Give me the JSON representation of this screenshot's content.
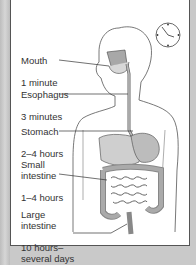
{
  "diagram": {
    "icon": "clock-icon",
    "labels": [
      {
        "organ": "Mouth",
        "time": "1 minute"
      },
      {
        "organ": "Esophagus",
        "time": "3 minutes"
      },
      {
        "organ": "Stomach",
        "time": "2–4 hours"
      },
      {
        "organ": "Small\nintestine",
        "time": "1–4 hours"
      },
      {
        "organ": "Large\nintestine",
        "time": "10 hours–\nseveral days"
      }
    ],
    "colors": {
      "border": "#c9c9c9",
      "panel": "#ffffff",
      "organ_fill": "#b0b0b0",
      "line": "#444444"
    }
  }
}
